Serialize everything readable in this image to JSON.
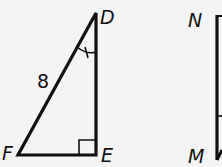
{
  "figure": {
    "triangle_def": {
      "vertices": {
        "D": "D",
        "E": "E",
        "F": "F"
      },
      "side_DF_length": "8",
      "right_angle_at": "E",
      "marked_angle_at": "D"
    },
    "triangle_mn": {
      "vertices": {
        "N": "N",
        "M": "M"
      }
    }
  },
  "colors": {
    "stroke": "#111111",
    "background": "#f4f4f4"
  }
}
